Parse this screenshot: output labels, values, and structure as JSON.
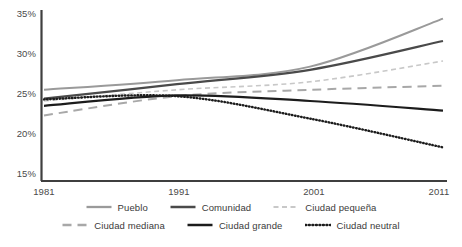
{
  "chart_data": {
    "type": "line",
    "title": "",
    "xlabel": "",
    "ylabel": "",
    "x": [
      1981,
      1991,
      2001,
      2011
    ],
    "xticklabels": [
      "1981",
      "1991",
      "2001",
      "2011"
    ],
    "xlim": [
      1981,
      2011
    ],
    "ylim": [
      15,
      35
    ],
    "yticks": [
      15,
      20,
      25,
      30,
      35
    ],
    "yticklabels": [
      "15%",
      "20%",
      "25%",
      "30%",
      "35%"
    ],
    "grid": false,
    "legend_position": "bottom",
    "series": [
      {
        "name": "Pueblo",
        "values": [
          25.4,
          26.6,
          28.3,
          34.3
        ],
        "color": "#9a9a9a",
        "style": "solid",
        "width": 2.0
      },
      {
        "name": "Comunidad",
        "values": [
          24.3,
          26.1,
          27.9,
          31.5
        ],
        "color": "#4a4a4a",
        "style": "solid",
        "width": 2.2
      },
      {
        "name": "Ciudad pequeña",
        "values": [
          24.0,
          25.4,
          26.4,
          29.0
        ],
        "color": "#c8c8c8",
        "style": "dashed-fine",
        "width": 1.6
      },
      {
        "name": "Ciudad mediana",
        "values": [
          22.2,
          24.6,
          25.4,
          25.9
        ],
        "color": "#a8a8a8",
        "style": "dashed-long",
        "width": 2.0
      },
      {
        "name": "Ciudad grande",
        "values": [
          23.4,
          24.7,
          24.0,
          22.8
        ],
        "color": "#1c1c1c",
        "style": "solid",
        "width": 2.2
      },
      {
        "name": "Ciudad neutral",
        "values": [
          24.2,
          24.6,
          21.8,
          18.2
        ],
        "color": "#1c1c1c",
        "style": "dotted",
        "width": 2.4
      }
    ]
  },
  "legend": {
    "rows": [
      [
        "Pueblo",
        "Comunidad",
        "Ciudad pequeña"
      ],
      [
        "Ciudad mediana",
        "Ciudad grande",
        "Ciudad neutral"
      ]
    ]
  }
}
